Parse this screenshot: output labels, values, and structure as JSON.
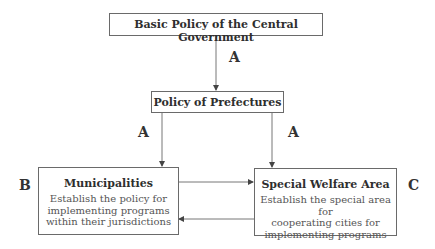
{
  "diagram": {
    "nodes": {
      "central": {
        "title": "Basic Policy of the Central Government"
      },
      "prefectures": {
        "title": "Policy of Prefectures"
      },
      "municipalities": {
        "title": "Municipalities",
        "desc": [
          "Establish the policy for",
          "implementing programs",
          "within their jurisdictions"
        ]
      },
      "welfare": {
        "title": "Special Welfare Area",
        "desc": [
          "Establish the special area for",
          "cooperating cities for",
          "implementing programs"
        ]
      }
    },
    "labels": {
      "edge_central_prefectures": "A",
      "edge_prefectures_municipalities": "A",
      "edge_prefectures_welfare": "A",
      "side_municipalities": "B",
      "side_welfare": "C"
    },
    "edges": [
      {
        "from": "central",
        "to": "prefectures",
        "label": "A"
      },
      {
        "from": "prefectures",
        "to": "municipalities",
        "label": "A"
      },
      {
        "from": "prefectures",
        "to": "welfare",
        "label": "A"
      },
      {
        "from": "municipalities",
        "to": "welfare",
        "label": ""
      },
      {
        "from": "welfare",
        "to": "municipalities",
        "label": ""
      }
    ]
  }
}
